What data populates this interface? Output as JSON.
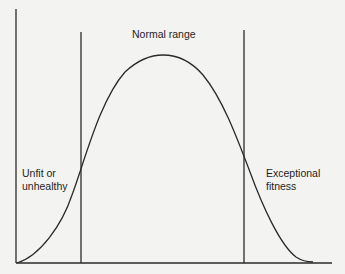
{
  "diagram": {
    "type": "normal-distribution",
    "line_color": "#2a2a2a",
    "background": "#f3f3f1",
    "labels": {
      "center": "Normal range",
      "left_line1": "Unfit or",
      "left_line2": "unhealthy",
      "right_line1": "Exceptional",
      "right_line2": "fitness"
    },
    "regions": [
      {
        "name": "Unfit or unhealthy",
        "position": "left tail"
      },
      {
        "name": "Normal range",
        "position": "center"
      },
      {
        "name": "Exceptional fitness",
        "position": "right tail"
      }
    ]
  }
}
